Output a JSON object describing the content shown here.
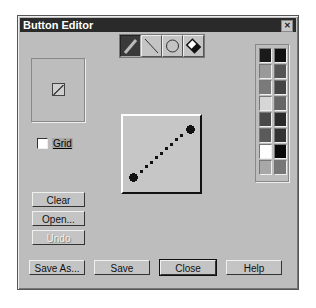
{
  "window": {
    "title": "Button Editor",
    "close_icon": "close-icon"
  },
  "preview": {
    "icon": "diagonal-line-icon"
  },
  "grid": {
    "label": "Grid",
    "checked": false
  },
  "left_buttons": [
    {
      "label": "Clear",
      "enabled": true
    },
    {
      "label": "Open...",
      "enabled": true
    },
    {
      "label": "Undo",
      "enabled": false
    }
  ],
  "tools": [
    {
      "name": "pencil",
      "selected": true
    },
    {
      "name": "line",
      "selected": false
    },
    {
      "name": "ellipse",
      "selected": false
    },
    {
      "name": "eraser",
      "selected": false
    }
  ],
  "palette": {
    "colors": [
      "#1a1a1a",
      "#111111",
      "#9a9a9a",
      "#555555",
      "#7a7a7a",
      "#444444",
      "#d6d6d6",
      "#666666",
      "#4a4a4a",
      "#2a2a2a",
      "#5a5a5a",
      "#333333",
      "#ffffff",
      "#0a0a0a",
      "#a8a8a8",
      "#777777"
    ]
  },
  "bottom_buttons": [
    {
      "label": "Save As..."
    },
    {
      "label": "Save"
    },
    {
      "label": "Close"
    },
    {
      "label": "Help"
    }
  ]
}
